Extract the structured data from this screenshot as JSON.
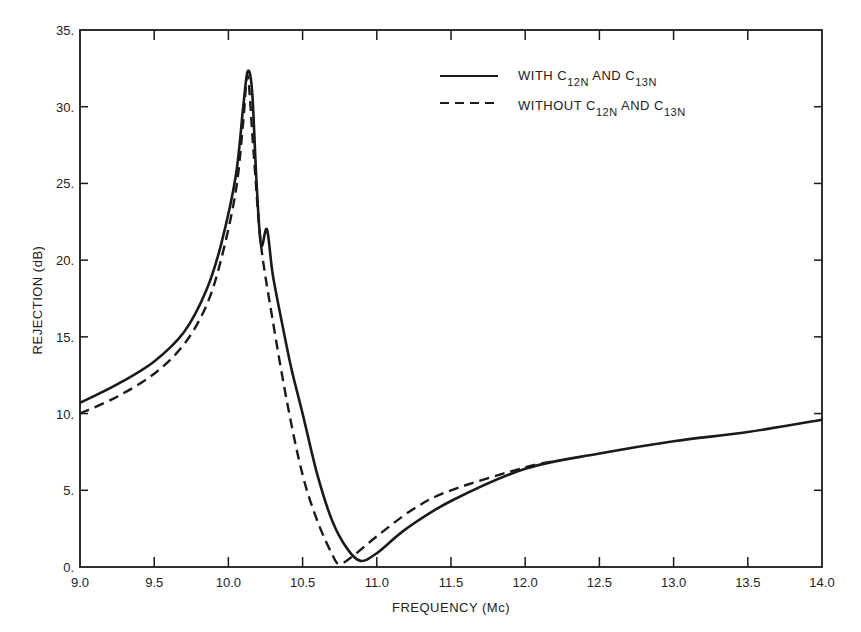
{
  "chart_data": {
    "type": "line",
    "title": "",
    "xlabel": "FREQUENCY (Mc)",
    "ylabel": "REJECTION (dB)",
    "xlim": [
      9.0,
      14.0
    ],
    "ylim": [
      0,
      35
    ],
    "x_ticks": [
      "9.0",
      "9.5",
      "10.0",
      "10.5",
      "11.0",
      "11.5",
      "12.0",
      "12.5",
      "13.0",
      "13.5",
      "14.0"
    ],
    "y_ticks": [
      "0.",
      "5.",
      "10.",
      "15.",
      "20.",
      "25.",
      "30.",
      "35."
    ],
    "grid": false,
    "legend_position": "upper right",
    "series": [
      {
        "name": "WITH C12N AND C13N",
        "legend_main": "WITH C",
        "style": "solid",
        "points": [
          [
            9.0,
            10.7
          ],
          [
            9.25,
            11.9
          ],
          [
            9.5,
            13.4
          ],
          [
            9.7,
            15.3
          ],
          [
            9.85,
            18.0
          ],
          [
            9.95,
            21.0
          ],
          [
            10.05,
            25.5
          ],
          [
            10.1,
            30.0
          ],
          [
            10.13,
            32.3
          ],
          [
            10.16,
            31.0
          ],
          [
            10.19,
            25.0
          ],
          [
            10.22,
            21.0
          ],
          [
            10.26,
            22.0
          ],
          [
            10.3,
            19.0
          ],
          [
            10.38,
            15.0
          ],
          [
            10.43,
            12.7
          ],
          [
            10.5,
            10.0
          ],
          [
            10.6,
            6.0
          ],
          [
            10.7,
            3.0
          ],
          [
            10.8,
            1.2
          ],
          [
            10.89,
            0.4
          ],
          [
            11.0,
            0.9
          ],
          [
            11.2,
            2.5
          ],
          [
            11.5,
            4.3
          ],
          [
            12.0,
            6.4
          ],
          [
            12.5,
            7.4
          ],
          [
            13.0,
            8.2
          ],
          [
            13.5,
            8.8
          ],
          [
            14.0,
            9.6
          ]
        ]
      },
      {
        "name": "WITHOUT C12N AND C13N",
        "style": "dashed",
        "points": [
          [
            9.0,
            10.0
          ],
          [
            9.25,
            11.1
          ],
          [
            9.5,
            12.6
          ],
          [
            9.7,
            14.5
          ],
          [
            9.85,
            17.0
          ],
          [
            9.95,
            20.0
          ],
          [
            10.05,
            24.5
          ],
          [
            10.1,
            29.0
          ],
          [
            10.13,
            32.0
          ],
          [
            10.17,
            27.0
          ],
          [
            10.22,
            21.0
          ],
          [
            10.3,
            16.0
          ],
          [
            10.4,
            10.5
          ],
          [
            10.5,
            6.0
          ],
          [
            10.6,
            3.0
          ],
          [
            10.7,
            0.8
          ],
          [
            10.75,
            0.2
          ],
          [
            10.85,
            0.8
          ],
          [
            11.0,
            2.0
          ],
          [
            11.25,
            3.8
          ],
          [
            11.5,
            5.0
          ],
          [
            12.0,
            6.5
          ],
          [
            12.2,
            6.9
          ]
        ]
      }
    ]
  },
  "legend": {
    "solid": {
      "prefix": "WITH C",
      "sub1": "12N",
      "mid": " AND C",
      "sub2": "13N"
    },
    "dashed": {
      "prefix": "WITHOUT C",
      "sub1": "12N",
      "mid": " AND C",
      "sub2": "13N"
    }
  },
  "colors": {
    "line": "#1a1a1a",
    "background": "#ffffff"
  }
}
